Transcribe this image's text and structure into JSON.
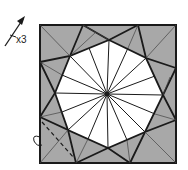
{
  "diagram": {
    "type": "origami-step",
    "repeat_label": "x3",
    "icons": [
      "valley-fold-arrow-icon",
      "turn-over-arrow-icon"
    ],
    "colors": {
      "paper_colored": "#a8a8a8",
      "paper_white": "#ffffff",
      "line": "#1a1a1a"
    }
  }
}
